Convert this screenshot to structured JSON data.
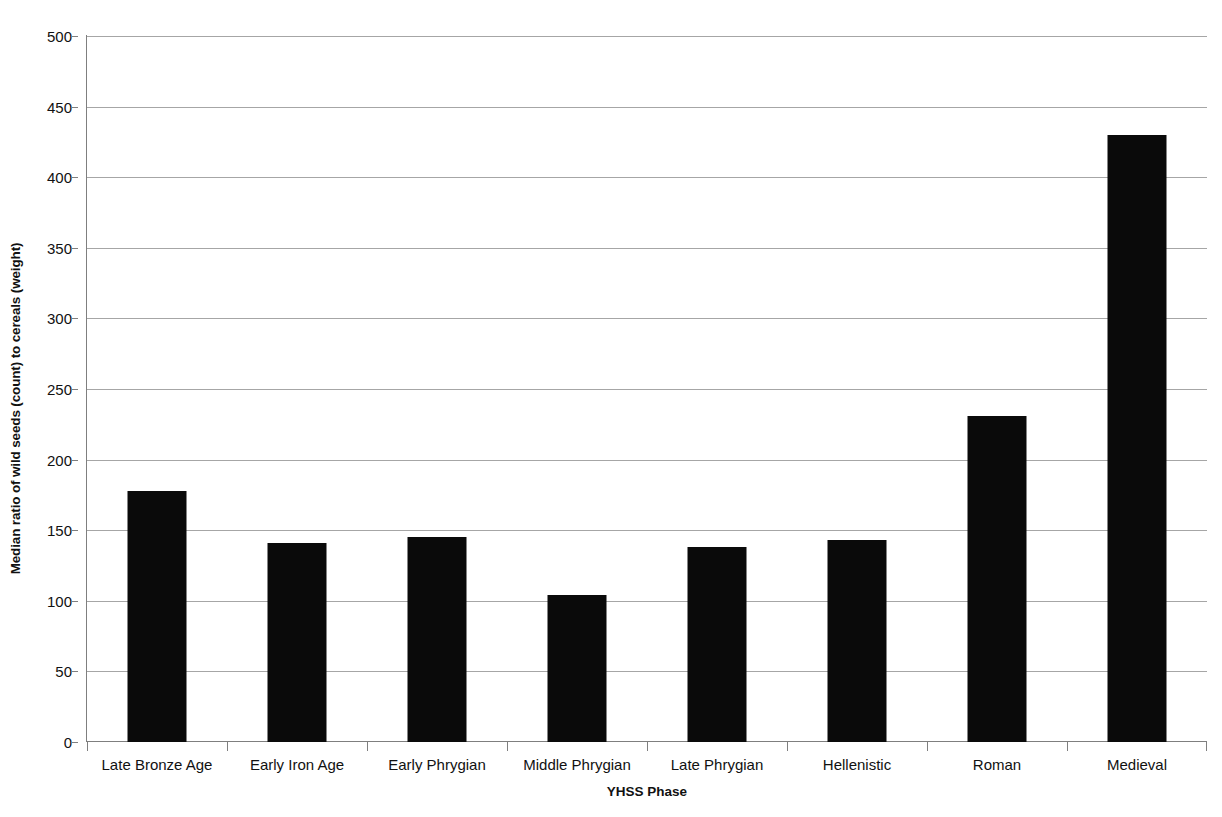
{
  "chart_data": {
    "type": "bar",
    "title": "",
    "xlabel": "YHSS Phase",
    "ylabel": "Median ratio of wild seeds (count) to cereals (weight)",
    "categories": [
      "Late Bronze Age",
      "Early Iron Age",
      "Early Phrygian",
      "Middle Phrygian",
      "Late Phrygian",
      "Hellenistic",
      "Roman",
      "Medieval"
    ],
    "values": [
      178,
      141,
      145,
      104,
      138,
      143,
      231,
      430
    ],
    "ylim": [
      0,
      500
    ],
    "ytick_step": 50,
    "yticks": [
      0,
      50,
      100,
      150,
      200,
      250,
      300,
      350,
      400,
      450,
      500
    ],
    "ytick_labels": [
      "0",
      "50",
      "100",
      "150",
      "200",
      "250",
      "300",
      "350",
      "400",
      "450",
      "500"
    ],
    "grid": true,
    "grid_axis": "y",
    "legend": false,
    "bar_color": "#0a0a0a",
    "grid_color": "#a6a6a6",
    "axis_color": "#7f7f7f",
    "background_color": "#ffffff"
  }
}
